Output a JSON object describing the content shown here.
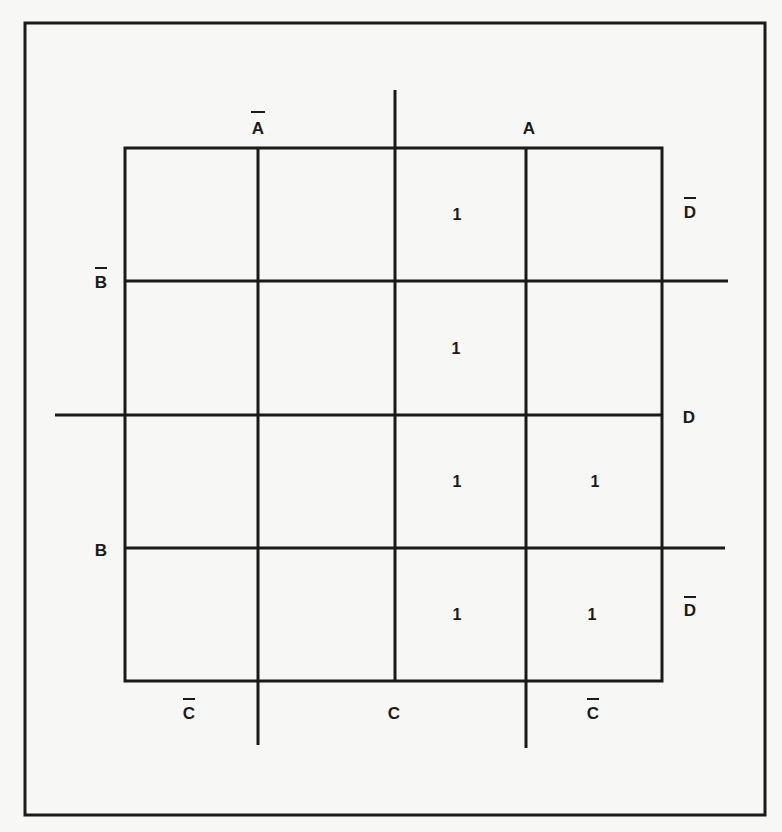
{
  "diagram": {
    "type": "karnaugh-map",
    "variables": [
      "A",
      "B",
      "C",
      "D"
    ],
    "colors": {
      "line": "#1a1a1a",
      "background": "#f7f7f5"
    },
    "labels": {
      "top_not_a": "A",
      "top_a": "A",
      "left_not_b": "B",
      "left_b": "B",
      "right_not_d_top": "D",
      "right_d": "D",
      "right_not_d_bottom": "D",
      "bottom_not_c_left": "C",
      "bottom_c": "C",
      "bottom_not_c_right": "C"
    },
    "overbars": {
      "top_not_a": true,
      "top_a": false,
      "left_not_b": true,
      "left_b": false,
      "right_not_d_top": true,
      "right_d": false,
      "right_not_d_bottom": true,
      "bottom_not_c_left": true,
      "bottom_c": false,
      "bottom_not_c_right": true
    },
    "cells": [
      [
        "",
        "",
        "1",
        ""
      ],
      [
        "",
        "",
        "1",
        ""
      ],
      [
        "",
        "",
        "1",
        "1"
      ],
      [
        "",
        "",
        "1",
        "1"
      ]
    ]
  }
}
